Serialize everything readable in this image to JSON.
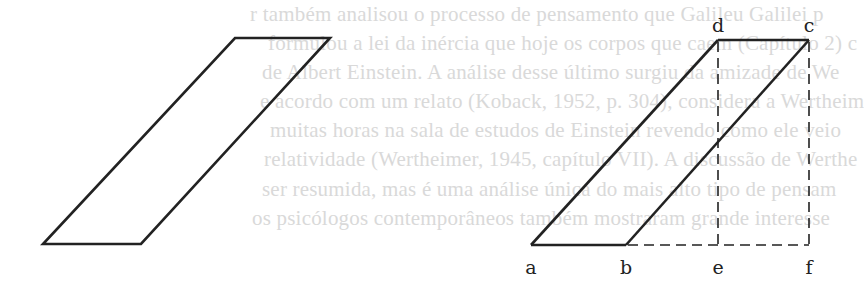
{
  "background_text": {
    "color": "#d9d9d9",
    "lines": [
      {
        "text": "r também analisou o processo de pensamento que Galileu Galilei p",
        "x": 250,
        "y": 2
      },
      {
        "text": "formulou a lei da inércia que hoje os corpos que caem (Capítulo 2) c",
        "x": 268,
        "y": 31
      },
      {
        "text": "de Albert Einstein. A análise desse último surgiu da amizade de We",
        "x": 262,
        "y": 60
      },
      {
        "text": "e acordo com um relato (Koback, 1952, p. 304), considera a Wertheim",
        "x": 260,
        "y": 89
      },
      {
        "text": "muitas horas na sala de estudos de Einstein revendo como ele veio",
        "x": 270,
        "y": 118
      },
      {
        "text": "relatividade (Wertheimer, 1945, capítulo VII). A discussão de Werthe",
        "x": 264,
        "y": 147
      },
      {
        "text": "ser resumida, mas é uma análise única do mais alto tipo de pensam",
        "x": 262,
        "y": 177
      },
      {
        "text": "os psicólogos contemporâneos também mostraram grande interesse",
        "x": 252,
        "y": 206
      }
    ]
  },
  "left_parallelogram": {
    "points": [
      [
        43,
        244
      ],
      [
        141,
        244
      ],
      [
        330,
        38
      ],
      [
        235,
        38
      ]
    ],
    "stroke": "#222222"
  },
  "right_figure": {
    "stroke": "#222222",
    "vertices": {
      "a": [
        531,
        245
      ],
      "b": [
        626,
        245
      ],
      "e": [
        718,
        245
      ],
      "f": [
        809,
        245
      ],
      "d": [
        718,
        40
      ],
      "c": [
        809,
        40
      ]
    },
    "solid_edges": [
      [
        "a",
        "b"
      ],
      [
        "a",
        "d"
      ],
      [
        "d",
        "c"
      ],
      [
        "b",
        "c"
      ]
    ],
    "dashed_edges": [
      [
        "b",
        "f"
      ],
      [
        "d",
        "e"
      ],
      [
        "c",
        "f"
      ]
    ],
    "labels": [
      {
        "text": "a",
        "x": 531,
        "y": 274
      },
      {
        "text": "b",
        "x": 626,
        "y": 274
      },
      {
        "text": "e",
        "x": 718,
        "y": 274
      },
      {
        "text": "f",
        "x": 809,
        "y": 274
      },
      {
        "text": "d",
        "x": 718,
        "y": 32
      },
      {
        "text": "c",
        "x": 809,
        "y": 32
      }
    ]
  }
}
